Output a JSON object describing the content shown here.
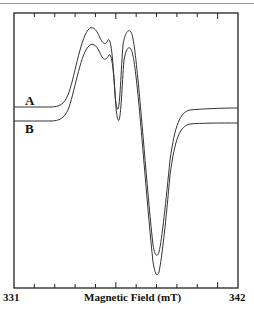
{
  "chart_data": {
    "type": "line",
    "title": "",
    "xlabel": "Magnetic Field (mT)",
    "ylabel": "",
    "xlim": [
      331,
      342
    ],
    "x_tick_labels": [
      "331",
      "342"
    ],
    "grid": false,
    "legend": "inline labels at left",
    "series": [
      {
        "name": "A",
        "x": [
          331,
          333,
          334,
          335,
          335.8,
          336.4,
          336.8,
          337.1,
          337.4,
          337.8,
          338.2,
          338.6,
          339.2,
          339.6,
          340,
          341,
          342
        ],
        "y": [
          0.0,
          0.0,
          0.3,
          0.75,
          0.95,
          0.75,
          0.0,
          0.95,
          0.85,
          0.0,
          -0.8,
          -1.8,
          -0.6,
          -0.05,
          -0.01,
          -0.01,
          -0.01
        ]
      },
      {
        "name": "B",
        "x": [
          331,
          333,
          334,
          335,
          335.8,
          336.4,
          336.8,
          337.1,
          337.4,
          337.8,
          338.2,
          338.6,
          339.2,
          339.6,
          340,
          341,
          342
        ],
        "y": [
          0.0,
          0.0,
          0.3,
          0.7,
          0.88,
          0.7,
          0.0,
          0.85,
          0.75,
          0.0,
          -0.85,
          -1.9,
          -0.65,
          -0.05,
          -0.01,
          -0.01,
          -0.01
        ]
      }
    ]
  },
  "labels": {
    "series_a": "A",
    "series_b": "B",
    "x_min": "331",
    "x_max": "342",
    "x_axis": "Magnetic Field (mT)"
  }
}
